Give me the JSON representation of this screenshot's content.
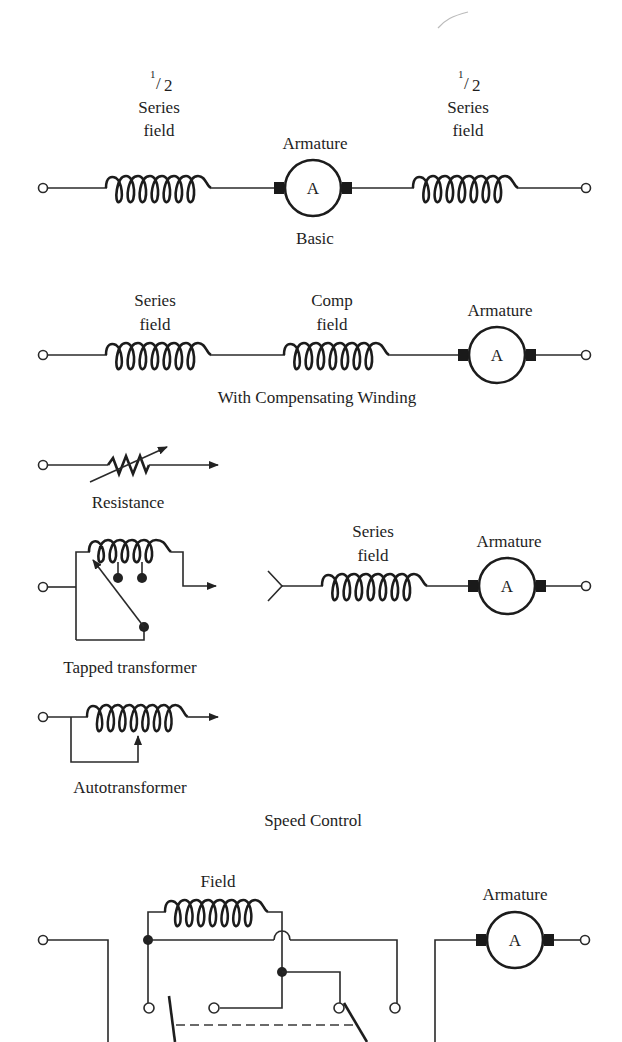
{
  "colors": {
    "ink": "#1e1e1e",
    "background": "#ffffff"
  },
  "basic": {
    "left_label": {
      "fraction_num": "1",
      "fraction_den": "2",
      "line1": "Series",
      "line2": "field"
    },
    "armature_label": "Armature",
    "armature_glyph": "A",
    "right_label": {
      "fraction_num": "1",
      "fraction_den": "2",
      "line1": "Series",
      "line2": "field"
    },
    "caption": "Basic"
  },
  "compensating": {
    "series_label": {
      "line1": "Series",
      "line2": "field"
    },
    "comp_label": {
      "line1": "Comp",
      "line2": "field"
    },
    "armature_label": "Armature",
    "armature_glyph": "A",
    "caption": "With Compensating Winding"
  },
  "speed_control": {
    "resistance_caption": "Resistance",
    "tapped_caption": "Tapped transformer",
    "auto_caption": "Autotransformer",
    "series_label": {
      "line1": "Series",
      "line2": "field"
    },
    "armature_label": "Armature",
    "armature_glyph": "A",
    "caption": "Speed Control"
  },
  "reversing": {
    "field_label": "Field",
    "armature_label": "Armature",
    "armature_glyph": "A"
  }
}
